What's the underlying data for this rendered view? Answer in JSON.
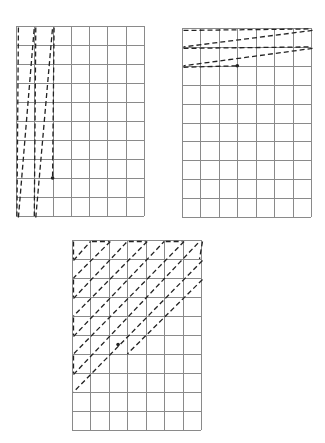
{
  "figure": {
    "colors": {
      "grid": "#8a8a8a",
      "path": "#222222",
      "background": "#ffffff"
    }
  },
  "grids": [
    {
      "name": "column-scan-grid",
      "label": "Vertical (column-wise) scan",
      "x": 16,
      "y": 26,
      "w": 128,
      "h": 190,
      "cols": 7,
      "rows": 10,
      "paths": [
        [
          [
            0.05,
            0.0
          ],
          [
            0.05,
            10.0
          ]
        ],
        [
          [
            0.05,
            10.0
          ],
          [
            1.0,
            0.0
          ]
        ],
        [
          [
            1.0,
            0.0
          ],
          [
            1.0,
            10.0
          ]
        ],
        [
          [
            1.0,
            10.0
          ],
          [
            2.0,
            0.0
          ]
        ],
        [
          [
            2.0,
            0.0
          ],
          [
            2.0,
            8.0
          ]
        ]
      ],
      "arrow_end": [
        2.0,
        8.0
      ]
    },
    {
      "name": "row-scan-grid",
      "label": "Horizontal (row-wise) scan",
      "x": 182,
      "y": 28,
      "w": 129,
      "h": 189,
      "cols": 7,
      "rows": 10,
      "paths": [
        [
          [
            0.0,
            0.05
          ],
          [
            7.0,
            0.05
          ]
        ],
        [
          [
            7.0,
            0.05
          ],
          [
            0.0,
            1.0
          ]
        ],
        [
          [
            0.0,
            1.0
          ],
          [
            7.0,
            1.0
          ]
        ],
        [
          [
            7.0,
            1.0
          ],
          [
            0.0,
            2.0
          ]
        ],
        [
          [
            0.0,
            2.0
          ],
          [
            3.0,
            2.0
          ]
        ]
      ],
      "arrow_end": [
        3.0,
        2.0
      ]
    },
    {
      "name": "diagonal-scan-grid",
      "label": "Diagonal scan",
      "x": 72,
      "y": 240,
      "w": 129,
      "h": 190,
      "cols": 7,
      "rows": 10,
      "paths": [
        [
          [
            0.0,
            0.0
          ],
          [
            0.0,
            1.0
          ]
        ],
        [
          [
            0.0,
            1.0
          ],
          [
            1.0,
            0.0
          ]
        ],
        [
          [
            1.0,
            0.0
          ],
          [
            2.0,
            0.0
          ]
        ],
        [
          [
            2.0,
            0.0
          ],
          [
            0.0,
            2.0
          ]
        ],
        [
          [
            0.0,
            2.0
          ],
          [
            0.0,
            3.0
          ]
        ],
        [
          [
            0.0,
            3.0
          ],
          [
            3.0,
            0.0
          ]
        ],
        [
          [
            3.0,
            0.0
          ],
          [
            4.0,
            0.0
          ]
        ],
        [
          [
            4.0,
            0.0
          ],
          [
            0.0,
            4.0
          ]
        ],
        [
          [
            0.0,
            4.0
          ],
          [
            0.0,
            5.0
          ]
        ],
        [
          [
            0.0,
            5.0
          ],
          [
            5.0,
            0.0
          ]
        ],
        [
          [
            5.0,
            0.0
          ],
          [
            6.0,
            0.0
          ]
        ],
        [
          [
            6.0,
            0.0
          ],
          [
            0.0,
            6.0
          ]
        ],
        [
          [
            0.0,
            6.0
          ],
          [
            0.0,
            7.0
          ]
        ],
        [
          [
            0.0,
            7.0
          ],
          [
            7.0,
            0.0
          ]
        ],
        [
          [
            7.0,
            0.0
          ],
          [
            7.0,
            1.0
          ]
        ],
        [
          [
            7.0,
            1.0
          ],
          [
            0.0,
            8.0
          ]
        ],
        [
          [
            0.0,
            8.0
          ],
          [
            0.0,
            8.0
          ]
        ],
        [
          [
            7.0,
            2.0
          ],
          [
            3.0,
            6.0
          ]
        ]
      ],
      "arrow_end": [
        2.5,
        5.5
      ]
    }
  ]
}
